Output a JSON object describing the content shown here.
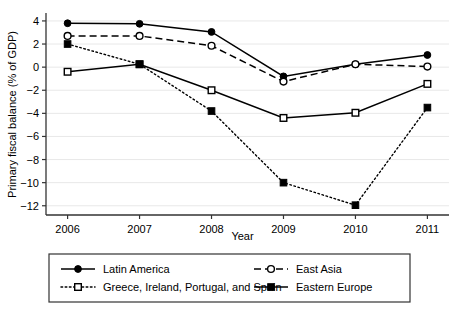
{
  "chart_data": {
    "type": "line",
    "title": "",
    "xlabel": "Year",
    "ylabel": "Primary fiscal balance (% of GDP)",
    "categories": [
      "2006",
      "2007",
      "2008",
      "2009",
      "2010",
      "2011"
    ],
    "x": [
      2006,
      2007,
      2008,
      2009,
      2010,
      2011
    ],
    "xlim": [
      2005.7,
      2011.3
    ],
    "ylim": [
      -12.8,
      4.6
    ],
    "yticks": [
      4,
      2,
      0,
      -2,
      -4,
      -6,
      -8,
      -10,
      -12
    ],
    "ytick_labels": [
      "4",
      "2",
      "0",
      "−2",
      "−4",
      "−6",
      "−8",
      "−10",
      "−12"
    ],
    "grid": "horizontal",
    "grid_color": "#e8e8e8",
    "legend_position": "bottom",
    "series": [
      {
        "name": "Latin America",
        "line": "solid",
        "marker": "filled-circle",
        "color": "#000000",
        "values": [
          3.8,
          3.75,
          3.05,
          -0.8,
          0.25,
          1.05
        ]
      },
      {
        "name": "East Asia",
        "line": "dashed",
        "marker": "open-circle",
        "color": "#000000",
        "values": [
          2.7,
          2.7,
          1.85,
          -1.25,
          0.25,
          0.05
        ]
      },
      {
        "name": "Greece, Ireland, Portugal, and Spain",
        "line": "solid",
        "marker": "open-square",
        "color": "#000000",
        "values": [
          -0.4,
          0.25,
          -2.0,
          -4.4,
          -3.95,
          -1.45
        ]
      },
      {
        "name": "Eastern Europe",
        "line": "dotted",
        "marker": "filled-square",
        "color": "#000000",
        "values": [
          2.0,
          0.25,
          -3.8,
          -10.0,
          -11.95,
          -3.5
        ]
      }
    ]
  },
  "legend": {
    "entries": [
      {
        "label": "Latin America",
        "swatch_line": "solid",
        "swatch_marker": "filled-circle"
      },
      {
        "label": "East Asia",
        "swatch_line": "dashed",
        "swatch_marker": "open-circle"
      },
      {
        "label": "Greece, Ireland, Portugal, and Spain",
        "swatch_line": "dotted",
        "swatch_marker": "open-square"
      },
      {
        "label": "Eastern Europe",
        "swatch_line": "solid",
        "swatch_marker": "filled-square"
      }
    ]
  }
}
